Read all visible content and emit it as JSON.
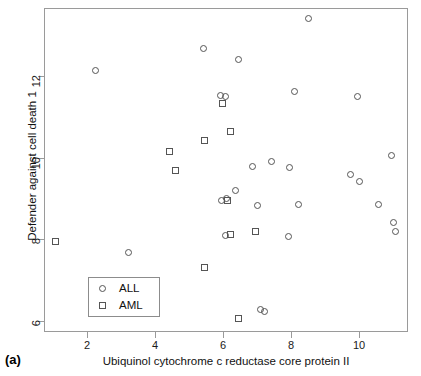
{
  "panel": {
    "tag": "(a)"
  },
  "axes": {
    "x": {
      "title": "Ubiquinol cytochrome c reductase core protein II",
      "ticks": [
        2,
        4,
        6,
        8,
        10
      ],
      "range": [
        0.75,
        11.4
      ]
    },
    "y": {
      "title": "Defender against cell death 1",
      "ticks": [
        6,
        8,
        10,
        12
      ],
      "range": [
        5.75,
        13.65
      ]
    }
  },
  "legend": {
    "items": [
      {
        "label": "ALL",
        "marker": "circle-marker"
      },
      {
        "label": "AML",
        "marker": "square-marker"
      }
    ]
  },
  "chart_data": {
    "type": "scatter",
    "title": "",
    "xlabel": "Ubiquinol cytochrome c reductase core protein II",
    "ylabel": "Defender against cell death 1",
    "xlim": [
      0.75,
      11.4
    ],
    "ylim": [
      5.75,
      13.65
    ],
    "xticks": [
      2,
      4,
      6,
      8,
      10
    ],
    "yticks": [
      6,
      8,
      10,
      12
    ],
    "grid": false,
    "legend_position": "lower-left",
    "series": [
      {
        "name": "ALL",
        "marker": "circle",
        "points": [
          [
            2.25,
            12.15
          ],
          [
            3.2,
            7.68
          ],
          [
            5.4,
            12.68
          ],
          [
            5.9,
            11.52
          ],
          [
            6.05,
            11.5
          ],
          [
            5.95,
            8.95
          ],
          [
            6.1,
            9.0
          ],
          [
            6.35,
            9.2
          ],
          [
            6.05,
            8.1
          ],
          [
            6.45,
            12.42
          ],
          [
            6.85,
            9.78
          ],
          [
            7.0,
            8.82
          ],
          [
            7.1,
            6.28
          ],
          [
            7.2,
            6.22
          ],
          [
            7.4,
            9.92
          ],
          [
            7.9,
            8.06
          ],
          [
            7.95,
            9.76
          ],
          [
            8.1,
            11.62
          ],
          [
            8.2,
            8.85
          ],
          [
            8.5,
            13.42
          ],
          [
            9.75,
            9.58
          ],
          [
            9.95,
            11.5
          ],
          [
            10.0,
            9.42
          ],
          [
            10.55,
            8.85
          ],
          [
            10.95,
            10.05
          ],
          [
            11.0,
            8.42
          ],
          [
            11.05,
            8.18
          ]
        ]
      },
      {
        "name": "AML",
        "marker": "square",
        "points": [
          [
            1.05,
            7.95
          ],
          [
            4.4,
            10.15
          ],
          [
            4.6,
            9.68
          ],
          [
            5.45,
            10.42
          ],
          [
            5.45,
            7.3
          ],
          [
            5.98,
            11.32
          ],
          [
            6.2,
            10.65
          ],
          [
            6.12,
            8.95
          ],
          [
            6.2,
            8.12
          ],
          [
            6.45,
            6.05
          ],
          [
            6.95,
            8.18
          ]
        ]
      }
    ]
  }
}
